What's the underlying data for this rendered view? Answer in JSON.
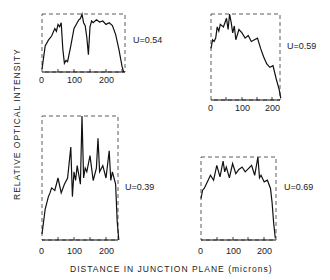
{
  "chart_data": [
    {
      "type": "line",
      "title": "",
      "annotation": "U=0.54",
      "xlabel": "DISTANCE IN JUNCTION PLANE (microns)",
      "ylabel": "RELATIVE OPTICAL INTENSITY",
      "x_ticks": [
        "0",
        "100",
        "200"
      ],
      "xlim": [
        0,
        260
      ],
      "ylim": [
        0,
        1
      ],
      "grid": false,
      "x": [
        0,
        10,
        20,
        30,
        40,
        45,
        50,
        55,
        60,
        65,
        70,
        75,
        80,
        90,
        100,
        110,
        115,
        120,
        125,
        130,
        135,
        140,
        145,
        150,
        155,
        160,
        170,
        180,
        190,
        200,
        210,
        220,
        230,
        240,
        250,
        255
      ],
      "values": [
        0.05,
        0.45,
        0.55,
        0.62,
        0.75,
        0.7,
        0.82,
        0.78,
        0.85,
        0.4,
        0.15,
        0.2,
        0.18,
        0.45,
        0.75,
        0.85,
        0.9,
        0.92,
        1.0,
        0.85,
        0.8,
        0.6,
        0.3,
        0.78,
        0.88,
        0.85,
        0.9,
        0.86,
        0.88,
        0.82,
        0.85,
        0.8,
        0.65,
        0.4,
        0.1,
        0.0
      ]
    },
    {
      "type": "line",
      "title": "",
      "annotation": "U=0.59",
      "xlabel": "DISTANCE IN JUNCTION PLANE (microns)",
      "ylabel": "RELATIVE OPTICAL INTENSITY",
      "x_ticks": [
        "0",
        "100",
        "200"
      ],
      "xlim": [
        0,
        225
      ],
      "ylim": [
        0,
        1
      ],
      "grid": false,
      "x": [
        0,
        5,
        10,
        15,
        20,
        25,
        30,
        40,
        50,
        55,
        60,
        65,
        70,
        75,
        80,
        90,
        100,
        110,
        120,
        130,
        140,
        150,
        160,
        170,
        180,
        190,
        200,
        210,
        220,
        225
      ],
      "values": [
        0.6,
        0.7,
        0.68,
        0.72,
        0.85,
        0.8,
        0.88,
        0.85,
        0.95,
        0.82,
        1.0,
        0.9,
        0.78,
        0.86,
        0.7,
        0.82,
        0.78,
        0.72,
        0.75,
        0.68,
        0.7,
        0.72,
        0.6,
        0.5,
        0.42,
        0.38,
        0.4,
        0.25,
        0.12,
        0.02
      ]
    },
    {
      "type": "line",
      "title": "",
      "annotation": "U=0.39",
      "xlabel": "DISTANCE IN JUNCTION PLANE (microns)",
      "ylabel": "RELATIVE OPTICAL INTENSITY",
      "x_ticks": [
        "0",
        "100",
        "200"
      ],
      "xlim": [
        0,
        240
      ],
      "ylim": [
        0,
        1
      ],
      "grid": false,
      "x": [
        0,
        10,
        20,
        25,
        30,
        40,
        50,
        60,
        70,
        80,
        90,
        95,
        100,
        105,
        110,
        120,
        125,
        130,
        135,
        140,
        150,
        160,
        170,
        175,
        180,
        190,
        200,
        210,
        215,
        220,
        230,
        235,
        240
      ],
      "values": [
        0.05,
        0.25,
        0.35,
        0.38,
        0.42,
        0.4,
        0.5,
        0.38,
        0.45,
        0.5,
        0.75,
        0.35,
        0.55,
        0.48,
        0.6,
        0.45,
        1.0,
        0.5,
        0.58,
        0.55,
        0.68,
        0.48,
        0.58,
        0.82,
        0.55,
        0.6,
        0.5,
        0.72,
        0.48,
        0.55,
        0.45,
        0.15,
        0.0
      ]
    },
    {
      "type": "line",
      "title": "",
      "annotation": "U=0.69",
      "xlabel": "DISTANCE IN JUNCTION PLANE (microns)",
      "ylabel": "RELATIVE OPTICAL INTENSITY",
      "x_ticks": [
        "0",
        "100",
        "200"
      ],
      "xlim": [
        0,
        240
      ],
      "ylim": [
        0,
        1
      ],
      "grid": false,
      "x": [
        0,
        5,
        10,
        20,
        30,
        40,
        50,
        60,
        70,
        75,
        80,
        90,
        100,
        110,
        120,
        130,
        140,
        150,
        160,
        170,
        180,
        185,
        190,
        200,
        210,
        220,
        225,
        230,
        235
      ],
      "values": [
        0.5,
        0.6,
        0.62,
        0.7,
        0.78,
        0.72,
        0.9,
        0.76,
        0.95,
        0.82,
        0.88,
        0.75,
        0.92,
        0.8,
        0.85,
        0.88,
        0.82,
        0.86,
        0.9,
        0.78,
        1.0,
        0.75,
        0.78,
        0.7,
        0.72,
        0.62,
        0.45,
        0.2,
        0.02
      ]
    }
  ],
  "figure": {
    "ylabel": "RELATIVE OPTICAL INTENSITY",
    "xlabel": "DISTANCE IN JUNCTION PLANE (microns)",
    "panels": [
      {
        "u_label": "U=0.54",
        "ticks": [
          "0",
          "100",
          "200"
        ]
      },
      {
        "u_label": "U=0.59",
        "ticks": [
          "0",
          "100",
          "200"
        ]
      },
      {
        "u_label": "U=0.39",
        "ticks": [
          "0",
          "100",
          "200"
        ]
      },
      {
        "u_label": "U=0.69",
        "ticks": [
          "0",
          "100",
          "200"
        ]
      }
    ]
  }
}
